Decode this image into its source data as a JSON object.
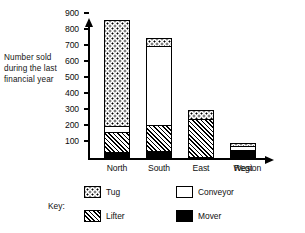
{
  "chart_data": {
    "type": "bar",
    "subtype": "stacked-bar",
    "title": "",
    "xlabel": "Region",
    "ylabel": "Number sold during the last financial year",
    "ylabel_lines": [
      "Number sold",
      "during the last",
      "financial year"
    ],
    "categories": [
      "North",
      "South",
      "East",
      "West"
    ],
    "ylim": [
      0,
      900
    ],
    "yticks": [
      100,
      200,
      300,
      400,
      500,
      600,
      700,
      800,
      900
    ],
    "ytick_labels": [
      "100",
      "200",
      "300",
      "400",
      "500",
      "600",
      "700",
      "800",
      "900"
    ],
    "grid": false,
    "legend_position": "bottom",
    "legend_title": "Key:",
    "series": [
      {
        "name": "Mover",
        "pattern": "solid-black",
        "values": [
          25,
          30,
          0,
          45
        ]
      },
      {
        "name": "Lifter",
        "pattern": "diagonal-hatch",
        "values": [
          125,
          170,
          240,
          0
        ]
      },
      {
        "name": "Conveyor",
        "pattern": "white",
        "values": [
          40,
          500,
          0,
          30
        ]
      },
      {
        "name": "Tug",
        "pattern": "dotted",
        "values": [
          670,
          50,
          60,
          20
        ]
      }
    ],
    "totals": [
      860,
      750,
      300,
      95
    ],
    "stack_order_bottom_to_top": [
      "Mover",
      "Lifter",
      "Conveyor",
      "Tug"
    ]
  },
  "legend": {
    "title": "Key:",
    "entries": [
      {
        "label": "Tug",
        "pattern": "dotted"
      },
      {
        "label": "Lifter",
        "pattern": "diagonal-hatch"
      },
      {
        "label": "Conveyor",
        "pattern": "white"
      },
      {
        "label": "Mover",
        "pattern": "solid-black"
      }
    ]
  },
  "colors": {
    "ink": "#000000",
    "paper": "#ffffff"
  }
}
